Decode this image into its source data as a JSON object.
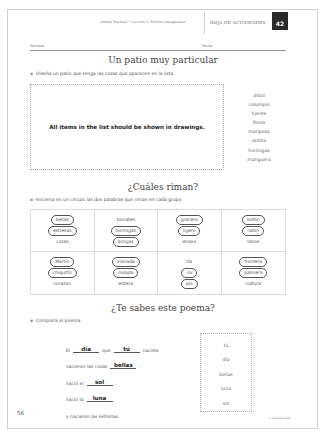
{
  "header": {
    "lesson": "¡Arriba Pinchan! • Lección 3: Felicitas Imaginarias",
    "sheet_label": "HOJA DE ACTIVIDADES",
    "sheet_number": "42"
  },
  "fields": {
    "name_label": "Nombre",
    "date_label": "Fecha"
  },
  "section1": {
    "title": "Un patio muy particular",
    "instruction": "Diseña un patio que tenga las cosas que aparecen en la lista.",
    "drawing_note": "All items in the list should be shown in drawings.",
    "items": [
      "árbol",
      "columpio",
      "fuente",
      "flores",
      "mariposa",
      "ardilla",
      "hormigas",
      "manguera"
    ]
  },
  "section2": {
    "title": "¿Cuáles riman?",
    "instruction": "Encierra en un círculo las dos palabras que riman en cada grupo.",
    "groups": [
      {
        "words": [
          {
            "w": "bellas",
            "c": true
          },
          {
            "w": "estrellas",
            "c": true
          },
          {
            "w": "cosas",
            "c": false
          }
        ]
      },
      {
        "words": [
          {
            "w": "tomates",
            "c": false
          },
          {
            "w": "hormigas",
            "c": true
          },
          {
            "w": "amigas",
            "c": true
          }
        ]
      },
      {
        "words": [
          {
            "w": "granero",
            "c": true
          },
          {
            "w": "ligero",
            "c": true
          },
          {
            "w": "enano",
            "c": false
          }
        ]
      },
      {
        "words": [
          {
            "w": "botón",
            "c": true
          },
          {
            "w": "ratón",
            "c": true
          },
          {
            "w": "libros",
            "c": false
          }
        ]
      },
      {
        "words": [
          {
            "w": "Martín",
            "c": true
          },
          {
            "w": "chiquitín",
            "c": true
          },
          {
            "w": "corazón",
            "c": false
          }
        ]
      },
      {
        "words": [
          {
            "w": "manada",
            "c": true
          },
          {
            "w": "rosada",
            "c": true
          },
          {
            "w": "entera",
            "c": false
          }
        ]
      },
      {
        "words": [
          {
            "w": "tía",
            "c": false
          },
          {
            "w": "río",
            "c": true
          },
          {
            "w": "pío",
            "c": true
          }
        ]
      },
      {
        "words": [
          {
            "w": "frontera",
            "c": true
          },
          {
            "w": "palmera",
            "c": true
          },
          {
            "w": "cultura",
            "c": false
          }
        ]
      }
    ]
  },
  "section3": {
    "title": "¿Te sabes este poema?",
    "instruction": "Completa el poema.",
    "lines": [
      {
        "before": "El",
        "blank": "día",
        "mid": "que",
        "blank2": "tú",
        "after": "naciste"
      },
      {
        "before": "nacieron las cosas",
        "blank": "bellas",
        "after": "."
      },
      {
        "before": "nació el",
        "blank": "sol",
        "after": ","
      },
      {
        "before": "nació la",
        "blank": "luna",
        "after": ""
      },
      {
        "before": "y nacieron las estrellas.",
        "blank": "",
        "after": ""
      }
    ],
    "word_bank": [
      "tú",
      "día",
      "bellas",
      "luna",
      "sol"
    ]
  },
  "footer": {
    "page_number": "56",
    "copyright": "© Santillana USA"
  }
}
